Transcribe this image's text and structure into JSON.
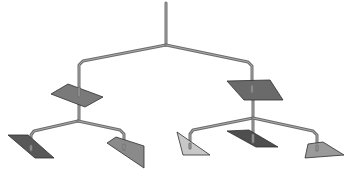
{
  "diagram": {
    "colors": {
      "background": "#ffffff",
      "rod": "#6e6e6e",
      "rod_highlight": "#a8a8a8",
      "panel_outline": "#2f2f2f"
    },
    "rods": [
      {
        "id": "top-pole",
        "points": "166,3 166,45"
      },
      {
        "id": "top-arm-left",
        "points": "166,45 83,61 79,65 79,90"
      },
      {
        "id": "top-arm-right",
        "points": "166,45 248,62 252,66 252,88"
      },
      {
        "id": "left-hanger",
        "points": "79,104 79,121"
      },
      {
        "id": "right-hanger",
        "points": "253,98 253,118"
      },
      {
        "id": "left-sub-arm-left",
        "points": "78,121 34,131 31,135 31,148"
      },
      {
        "id": "left-sub-arm-right",
        "points": "78,121 120,130 124,134 124,147"
      },
      {
        "id": "right-sub-arm-left",
        "points": "253,118 193,130 190,134 190,146"
      },
      {
        "id": "right-sub-center",
        "points": "253,118 253,141"
      },
      {
        "id": "right-sub-arm-right",
        "points": "253,118 313,131 317,135 317,148"
      }
    ],
    "panels": [
      {
        "id": "panel-upper-left",
        "shape": "parallelogram",
        "fill": "#7a7a7a",
        "points": "51,94 68,84 103,97 85,107"
      },
      {
        "id": "panel-upper-right",
        "shape": "parallelogram",
        "fill": "#6a6a6a",
        "points": "227,81 270,80 283,100 244,100"
      },
      {
        "id": "panel-lower-1",
        "shape": "parallelogram",
        "fill": "#585858",
        "points": "8,135 28,135 54,158 35,158"
      },
      {
        "id": "panel-lower-2",
        "shape": "quadrilateral",
        "fill": "#8a8a8a",
        "points": "107,143 116,137 144,146 144,168"
      },
      {
        "id": "panel-lower-3",
        "shape": "triangle",
        "fill": "#c8c8c8",
        "points": "177,132 183,155 210,155"
      },
      {
        "id": "panel-lower-4",
        "shape": "parallelogram",
        "fill": "#4e4e4e",
        "points": "227,131 249,130 278,147 256,147"
      },
      {
        "id": "panel-lower-5",
        "shape": "quadrilateral",
        "fill": "#9a9a9a",
        "points": "308,144 323,142 344,155 305,158"
      }
    ]
  }
}
